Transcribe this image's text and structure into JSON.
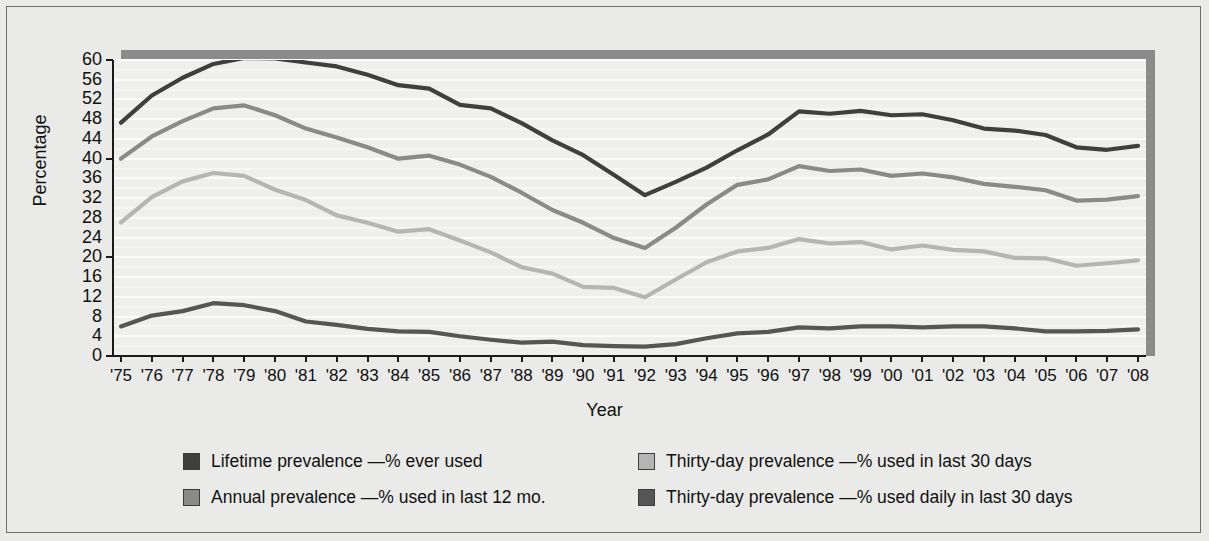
{
  "axes": {
    "y_title": "Percentage",
    "x_title": "Year",
    "y_ticks": [
      "60",
      "56",
      "52",
      "48",
      "44",
      "40",
      "36",
      "32",
      "28",
      "24",
      "20",
      "16",
      "12",
      "8",
      "4",
      "0"
    ],
    "x_ticks": [
      "'75",
      "'76",
      "'77",
      "'78",
      "'79",
      "'80",
      "'81",
      "'82",
      "'83",
      "'84",
      "'85",
      "'86",
      "'87",
      "'88",
      "'89",
      "'90",
      "'91",
      "'92",
      "'93",
      "'94",
      "'95",
      "'96",
      "'97",
      "'98",
      "'99",
      "'00",
      "'01",
      "'02",
      "'03",
      "'04",
      "'05",
      "'06",
      "'07",
      "'08"
    ]
  },
  "legend": [
    {
      "label": "Lifetime prevalence —% ever used",
      "color": "#3f3f3f"
    },
    {
      "label": "Thirty-day prevalence —% used in last 30 days",
      "color": "#b5b5b5"
    },
    {
      "label": "Annual prevalence —% used in last 12 mo.",
      "color": "#8a8a8a"
    },
    {
      "label": "Thirty-day prevalence —% used daily in last 30 days",
      "color": "#565656"
    }
  ],
  "colors": {
    "lifetime": "#3f3f3f",
    "annual": "#8a8a8a",
    "thirty_day": "#b5b5b5",
    "daily": "#565656",
    "plot_background": "#efefed",
    "gridline": "#fbfbfb",
    "frame_shadow": "#8b8b8b",
    "axis": "#1b1b1b",
    "page_background": "#eaeae8"
  },
  "chart_data": {
    "type": "line",
    "title": "",
    "xlabel": "Year",
    "ylabel": "Percentage",
    "ylim": [
      0,
      60
    ],
    "grid": true,
    "legend_position": "bottom",
    "categories": [
      "'75",
      "'76",
      "'77",
      "'78",
      "'79",
      "'80",
      "'81",
      "'82",
      "'83",
      "'84",
      "'85",
      "'86",
      "'87",
      "'88",
      "'89",
      "'90",
      "'91",
      "'92",
      "'93",
      "'94",
      "'95",
      "'96",
      "'97",
      "'98",
      "'99",
      "'00",
      "'01",
      "'02",
      "'03",
      "'04",
      "'05",
      "'06",
      "'07",
      "'08"
    ],
    "series": [
      {
        "name": "Lifetime prevalence —% ever used",
        "color": "#3f3f3f",
        "values": [
          47.3,
          52.8,
          56.4,
          59.2,
          60.4,
          60.3,
          59.5,
          58.7,
          57.0,
          54.9,
          54.2,
          50.9,
          50.2,
          47.2,
          43.7,
          40.7,
          36.7,
          32.6,
          35.3,
          38.2,
          41.7,
          44.9,
          49.6,
          49.1,
          49.7,
          48.8,
          49.0,
          47.8,
          46.1,
          45.7,
          44.8,
          42.3,
          41.8,
          42.6
        ]
      },
      {
        "name": "Annual prevalence —% used in last 12 mo.",
        "color": "#8a8a8a",
        "values": [
          40.0,
          44.5,
          47.6,
          50.2,
          50.8,
          48.8,
          46.1,
          44.3,
          42.3,
          40.0,
          40.6,
          38.8,
          36.3,
          33.1,
          29.6,
          27.0,
          23.9,
          21.9,
          26.0,
          30.7,
          34.7,
          35.8,
          38.5,
          37.5,
          37.8,
          36.5,
          37.0,
          36.2,
          34.9,
          34.3,
          33.6,
          31.5,
          31.7,
          32.4
        ]
      },
      {
        "name": "Thirty-day prevalence —% used in last 30 days",
        "color": "#b5b5b5",
        "values": [
          27.1,
          32.2,
          35.4,
          37.1,
          36.5,
          33.7,
          31.6,
          28.5,
          27.0,
          25.2,
          25.7,
          23.4,
          21.0,
          18.0,
          16.7,
          14.0,
          13.8,
          11.9,
          15.5,
          19.0,
          21.2,
          21.9,
          23.7,
          22.8,
          23.1,
          21.6,
          22.4,
          21.5,
          21.2,
          19.9,
          19.8,
          18.3,
          18.8,
          19.4
        ]
      },
      {
        "name": "Thirty-day prevalence —% used daily in last 30 days",
        "color": "#565656",
        "values": [
          6.0,
          8.2,
          9.1,
          10.7,
          10.3,
          9.1,
          7.0,
          6.3,
          5.5,
          5.0,
          4.9,
          4.0,
          3.3,
          2.7,
          2.9,
          2.2,
          2.0,
          1.9,
          2.4,
          3.6,
          4.6,
          4.9,
          5.8,
          5.6,
          6.0,
          6.0,
          5.8,
          6.0,
          6.0,
          5.6,
          5.0,
          5.0,
          5.1,
          5.4
        ]
      }
    ]
  }
}
